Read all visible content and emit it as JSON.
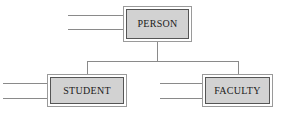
{
  "diagram": {
    "type": "class-hierarchy",
    "title": "",
    "nodes": [
      {
        "id": "person",
        "label": "PERSON",
        "role": "superclass"
      },
      {
        "id": "student",
        "label": "STUDENT",
        "role": "subclass"
      },
      {
        "id": "faculty",
        "label": "FACULTY",
        "role": "subclass"
      }
    ],
    "edges": [
      {
        "from": "person",
        "to": "student"
      },
      {
        "from": "person",
        "to": "faculty"
      }
    ],
    "attribute_stubs": {
      "person": 2,
      "student": 2,
      "faculty": 2
    },
    "colors": {
      "box_fill": "#d2d2d2",
      "box_inner_border": "#555555",
      "box_outer_border": "#9a9a9a",
      "line": "#8a8a8a",
      "text": "#1a1a1a",
      "background": "#ffffff"
    }
  }
}
